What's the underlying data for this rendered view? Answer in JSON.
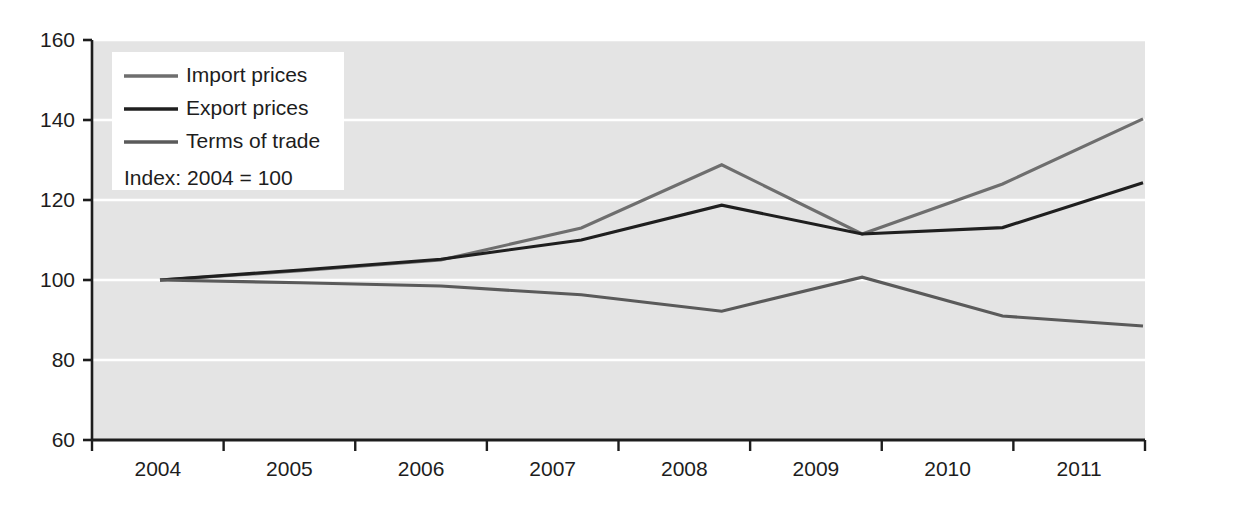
{
  "chart_data": {
    "type": "line",
    "title": "",
    "subtitle": "",
    "xlabel": "",
    "ylabel": "",
    "note": "Index: 2004 = 100",
    "categories": [
      "2004",
      "2005",
      "2006",
      "2007",
      "2008",
      "2009",
      "2010",
      "2011"
    ],
    "x": [
      2004,
      2005,
      2006,
      2007,
      2008,
      2009,
      2010,
      2011
    ],
    "ylim": [
      60,
      160
    ],
    "yticks": [
      60,
      80,
      100,
      120,
      140,
      160
    ],
    "ytick_labels": [
      "60",
      "80",
      "100",
      "120",
      "140",
      "160"
    ],
    "grid": "horizontal",
    "grid_color": "#ffffff",
    "plot_background": "#e4e4e4",
    "legend_position": "top-left",
    "series": [
      {
        "name": "Import prices",
        "color": "#6e6e6e",
        "values": [
          100.0,
          102.3,
          105.0,
          113.0,
          128.8,
          111.5,
          124.0,
          140.3
        ]
      },
      {
        "name": "Export prices",
        "color": "#1f1f1f",
        "values": [
          100.0,
          102.5,
          105.2,
          110.0,
          118.7,
          111.5,
          113.1,
          124.3
        ]
      },
      {
        "name": "Terms of trade",
        "color": "#5a5a5a",
        "values": [
          100.0,
          99.3,
          98.5,
          96.3,
          92.2,
          100.7,
          91.0,
          88.5
        ]
      }
    ]
  },
  "axis": {
    "axis_color": "#1d1d1d",
    "y_tick_labels": [
      "160",
      "140",
      "120",
      "100",
      "80",
      "60"
    ],
    "x_tick_labels": [
      "2004",
      "2005",
      "2006",
      "2007",
      "2008",
      "2009",
      "2010",
      "2011"
    ]
  },
  "legend": {
    "items": [
      {
        "label": "Import prices",
        "color": "#6e6e6e"
      },
      {
        "label": "Export prices",
        "color": "#1f1f1f"
      },
      {
        "label": "Terms of trade",
        "color": "#5a5a5a"
      }
    ],
    "note": "Index: 2004 = 100",
    "background": "#ffffff"
  }
}
